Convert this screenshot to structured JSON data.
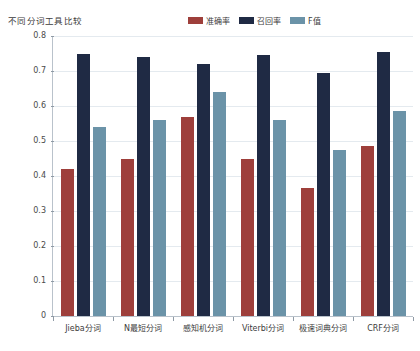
{
  "chart_data": {
    "type": "bar",
    "title": "不同分词工具比较",
    "xlabel": "",
    "ylabel": "",
    "ylim": [
      0,
      0.8
    ],
    "yticks": [
      "0",
      "0.1",
      "0.2",
      "0.3",
      "0.4",
      "0.5",
      "0.6",
      "0.7",
      "0.8"
    ],
    "ytick_values": [
      0,
      0.1,
      0.2,
      0.3,
      0.4,
      0.5,
      0.6,
      0.7,
      0.8
    ],
    "grid": true,
    "legend_position": "top-right",
    "categories": [
      "Jieba分词",
      "N最短分词",
      "感知机分词",
      "Viterbi分词",
      "极速词典分词",
      "CRF分词"
    ],
    "series": [
      {
        "name": "准确率",
        "color": "#9E3F3B",
        "values": [
          0.42,
          0.45,
          0.57,
          0.45,
          0.365,
          0.485
        ]
      },
      {
        "name": "召回率",
        "color": "#1F2A44",
        "values": [
          0.75,
          0.74,
          0.72,
          0.745,
          0.695,
          0.755
        ]
      },
      {
        "name": "F值",
        "color": "#6B93A8",
        "values": [
          0.54,
          0.56,
          0.64,
          0.56,
          0.475,
          0.585
        ]
      }
    ]
  },
  "colors": {
    "accuracy": "#9E3F3B",
    "recall": "#1F2A44",
    "fscore": "#6B93A8",
    "grid": "#E4EAEF",
    "axis": "#B9C2CB",
    "background": "#FFFFFF",
    "text": "#3C3C3C"
  }
}
